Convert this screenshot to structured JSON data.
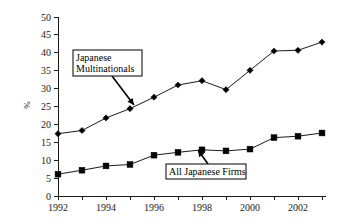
{
  "chart_data": {
    "type": "line",
    "title": "",
    "xlabel": "",
    "ylabel": "%",
    "x": [
      1992,
      1993,
      1994,
      1995,
      1996,
      1997,
      1998,
      1999,
      2000,
      2001,
      2002,
      2003
    ],
    "xlim": [
      1991.5,
      2003.5
    ],
    "ylim": [
      0,
      50
    ],
    "xticks": [
      1992,
      1993,
      1994,
      1995,
      1996,
      1997,
      1998,
      1999,
      2000,
      2001,
      2002,
      2003
    ],
    "xtick_labels": [
      "1992",
      "",
      "1994",
      "",
      "1996",
      "",
      "1998",
      "",
      "2000",
      "",
      "2002",
      ""
    ],
    "yticks": [
      0,
      5,
      10,
      15,
      20,
      25,
      30,
      35,
      40,
      45,
      50
    ],
    "ytick_labels": [
      "0",
      "5",
      "10",
      "15",
      "20",
      "25",
      "30",
      "35",
      "40",
      "45",
      "50"
    ],
    "grid": false,
    "legend_position": "inline-annotations",
    "series": [
      {
        "name": "Japanese Multinationals",
        "marker": "diamond",
        "color": "#000000",
        "values": [
          17.4,
          18.3,
          21.8,
          24.4,
          27.6,
          31.0,
          32.2,
          29.7,
          35.1,
          40.5,
          40.7,
          43.0
        ]
      },
      {
        "name": "All Japanese Firms",
        "marker": "square",
        "color": "#000000",
        "values": [
          6.1,
          7.2,
          8.4,
          8.8,
          11.4,
          12.2,
          12.9,
          12.6,
          13.1,
          16.3,
          16.7,
          17.6
        ]
      }
    ],
    "annotations": [
      {
        "id": "japanese-multinationals",
        "lines": [
          "Japanese",
          "Multinationals"
        ],
        "box": {
          "x": 73,
          "y": 50,
          "w": 69,
          "h": 26
        },
        "arrow": {
          "x1": 112,
          "y1": 76,
          "x2": 134,
          "y2": 105
        }
      },
      {
        "id": "all-japanese-firms",
        "lines": [
          "All Japanese Firms"
        ],
        "box": {
          "x": 166,
          "y": 164,
          "w": 80,
          "h": 15
        },
        "arrow": {
          "x1": 208,
          "y1": 164,
          "x2": 198,
          "y2": 150
        }
      }
    ]
  },
  "axes": {
    "y_axis_label": "%",
    "geometry": {
      "plot_left": 58,
      "plot_right": 322,
      "plot_bottom": 196,
      "plot_top": 17,
      "x_step_px": 24,
      "y_unit_px": 3.58
    }
  }
}
